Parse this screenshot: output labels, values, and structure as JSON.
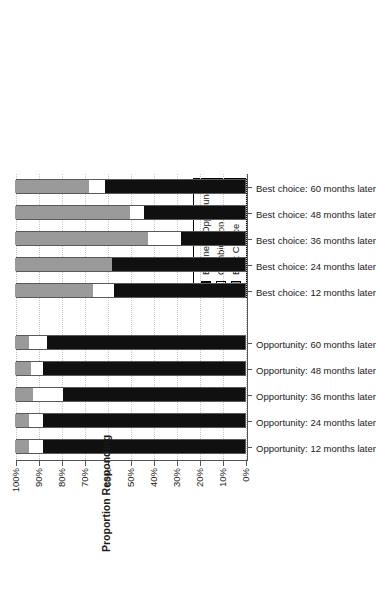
{
  "chart_data": {
    "type": "bar",
    "subtype": "stacked-horizontal-100pct",
    "title": "",
    "xlabel": "",
    "ylabel": "Proportion Responding",
    "axis_title": "Proportion Responding",
    "ylim": [
      0,
      100
    ],
    "tick_labels": [
      "0%",
      "10%",
      "20%",
      "30%",
      "40%",
      "50%",
      "60%",
      "70%",
      "80%",
      "90%",
      "100%"
    ],
    "tick_values": [
      0,
      10,
      20,
      30,
      40,
      50,
      60,
      70,
      80,
      90,
      100
    ],
    "grid": true,
    "legend_position": "top-center",
    "orientation": "rotated-90-ccw",
    "categories": [
      "Opportunity: 12 months later",
      "Opportunity: 24 months later",
      "Opportunity: 36 months later",
      "Opportunity: 48 months later",
      "Opportunity: 60 months later",
      "Best choice: 12 months later",
      "Best choice: 24 months later",
      "Best choice: 36 months later",
      "Best choice: 48 months later",
      "Best choice: 60 months later"
    ],
    "series": [
      {
        "name": "Business Opportunity",
        "color": "#101010",
        "values": [
          88,
          88,
          79,
          88,
          86,
          57,
          58,
          28,
          44,
          61
        ]
      },
      {
        "name": "Combination",
        "color": "#ffffff",
        "values": [
          6,
          6,
          13,
          5,
          8,
          9,
          0,
          14,
          6,
          7
        ]
      },
      {
        "name": "Best Choice",
        "color": "#9a9a9a",
        "values": [
          6,
          6,
          8,
          7,
          6,
          34,
          42,
          58,
          50,
          32
        ]
      }
    ]
  },
  "legend": {
    "items": [
      {
        "label": "Business Opportunity",
        "swatch": "black"
      },
      {
        "label": "Combination",
        "swatch": "white"
      },
      {
        "label": "Best Choice",
        "swatch": "gray"
      }
    ]
  },
  "axis": {
    "title": "Proportion Responding"
  }
}
